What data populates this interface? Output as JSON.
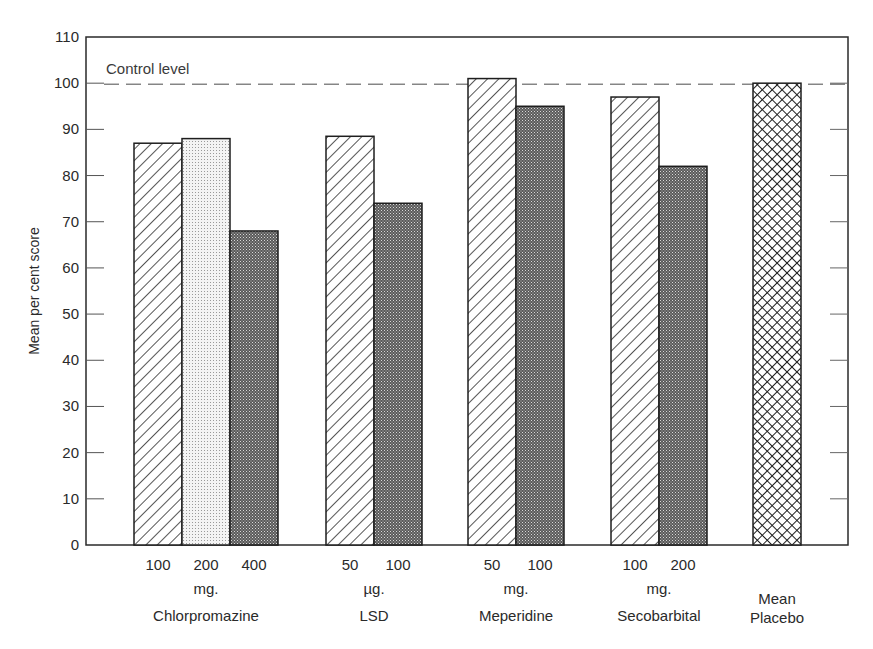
{
  "chart_data": {
    "type": "bar",
    "title": "",
    "xlabel": "",
    "ylabel": "Mean per cent score",
    "ylim": [
      0,
      110
    ],
    "yticks": [
      0,
      10,
      20,
      30,
      40,
      50,
      60,
      70,
      80,
      90,
      100,
      110
    ],
    "grid": false,
    "legend": "none",
    "reference_line": {
      "label": "Control level",
      "value": 100,
      "style": "dashed"
    },
    "groups": [
      {
        "name": "Chlorpromazine",
        "unit": "mg.",
        "bars": [
          {
            "dose": "100",
            "value": 87,
            "pattern": "diagonal-hatch"
          },
          {
            "dose": "200",
            "value": 88,
            "pattern": "light-dots"
          },
          {
            "dose": "400",
            "value": 68,
            "pattern": "dark-crosshatch"
          }
        ]
      },
      {
        "name": "LSD",
        "unit": "µg.",
        "bars": [
          {
            "dose": "50",
            "value": 88.5,
            "pattern": "diagonal-hatch"
          },
          {
            "dose": "100",
            "value": 74,
            "pattern": "dark-crosshatch"
          }
        ]
      },
      {
        "name": "Meperidine",
        "unit": "mg.",
        "bars": [
          {
            "dose": "50",
            "value": 101,
            "pattern": "diagonal-hatch"
          },
          {
            "dose": "100",
            "value": 95,
            "pattern": "dark-crosshatch"
          }
        ]
      },
      {
        "name": "Secobarbital",
        "unit": "mg.",
        "bars": [
          {
            "dose": "100",
            "value": 97,
            "pattern": "diagonal-hatch"
          },
          {
            "dose": "200",
            "value": 82,
            "pattern": "dark-crosshatch"
          }
        ]
      },
      {
        "name": "Mean Placebo",
        "name_lines": [
          "Mean",
          "Placebo"
        ],
        "unit": "",
        "bars": [
          {
            "dose": "",
            "value": 100,
            "pattern": "open-crosshatch"
          }
        ]
      }
    ]
  },
  "labels": {
    "ylabel": "Mean per cent score",
    "control": "Control level",
    "yticks": [
      "0",
      "10",
      "20",
      "30",
      "40",
      "50",
      "60",
      "70",
      "80",
      "90",
      "100",
      "110"
    ]
  }
}
